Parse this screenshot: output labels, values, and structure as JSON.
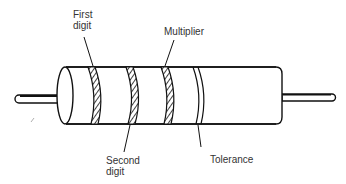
{
  "diagram": {
    "labels": {
      "first_digit": "First\ndigit",
      "multiplier": "Multiplier",
      "second_digit": "Second\ndigit",
      "tolerance": "Tolerance"
    },
    "bands": [
      {
        "name": "first-digit-band",
        "style": "hatched"
      },
      {
        "name": "second-digit-band",
        "style": "hatched"
      },
      {
        "name": "multiplier-band",
        "style": "hatched"
      },
      {
        "name": "tolerance-band",
        "style": "outline"
      }
    ],
    "colors": {
      "stroke": "#111111",
      "text": "#333333",
      "background": "#ffffff"
    }
  }
}
